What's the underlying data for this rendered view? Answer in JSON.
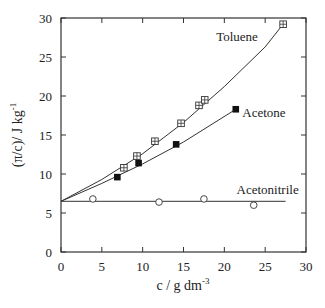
{
  "chart_data": {
    "type": "line",
    "title": "",
    "xlabel": "c / g dm",
    "xlabel_sup": "-3",
    "ylabel": "(π/c)/ J kg",
    "ylabel_sup": "-1",
    "xlim": [
      0,
      30
    ],
    "ylim": [
      0,
      30
    ],
    "xticks": [
      0,
      5,
      10,
      15,
      20,
      25,
      30
    ],
    "yticks": [
      0,
      5,
      10,
      15,
      20,
      25,
      30
    ],
    "grid": false,
    "intercept": 6.5,
    "series": [
      {
        "name": "Toluene",
        "marker": "crossed-square",
        "x": [
          7.7,
          9.3,
          11.5,
          14.7,
          16.9,
          17.6,
          27.2
        ],
        "y": [
          10.8,
          12.3,
          14.2,
          16.5,
          18.8,
          19.5,
          29.2
        ],
        "fit": [
          [
            0,
            6.5
          ],
          [
            5,
            9.3
          ],
          [
            10,
            12.6
          ],
          [
            15,
            16.6
          ],
          [
            20,
            21.2
          ],
          [
            25,
            26.3
          ],
          [
            27.2,
            29.2
          ]
        ],
        "label_pos": [
          19.0,
          27.0
        ]
      },
      {
        "name": "Acetone",
        "marker": "filled-square",
        "x": [
          6.9,
          9.5,
          14.1,
          21.4
        ],
        "y": [
          9.6,
          11.4,
          13.8,
          18.3
        ],
        "fit": [
          [
            0,
            6.5
          ],
          [
            5,
            8.8
          ],
          [
            10,
            11.3
          ],
          [
            15,
            14.1
          ],
          [
            21.4,
            18.3
          ]
        ],
        "label_pos": [
          22.2,
          17.3
        ]
      },
      {
        "name": "Acetonitrile",
        "marker": "open-circle",
        "x": [
          3.9,
          12.0,
          17.5,
          23.6
        ],
        "y": [
          6.8,
          6.4,
          6.8,
          6.0
        ],
        "fit": [
          [
            0,
            6.5
          ],
          [
            27.5,
            6.5
          ]
        ],
        "label_pos": [
          21.5,
          7.4
        ]
      }
    ]
  }
}
